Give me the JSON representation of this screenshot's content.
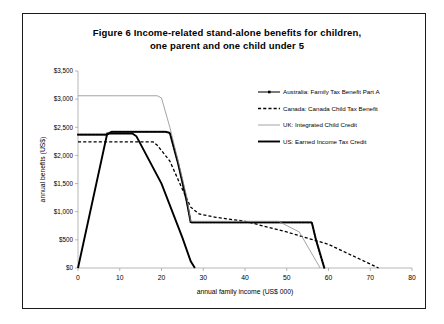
{
  "figure": {
    "title_line1": "Figure 6   Income-related stand-alone benefits for children,",
    "title_line2": "one parent and one child under 5"
  },
  "chart_data": {
    "type": "line",
    "title": "Figure 6 Income-related stand-alone benefits for children, one parent and one child under 5",
    "xlabel": "annual family income (US$ 000)",
    "ylabel": "annual benefits (US$)",
    "xlim": [
      0,
      80
    ],
    "ylim": [
      0,
      3500
    ],
    "xticks": [
      0,
      10,
      20,
      30,
      40,
      50,
      60,
      70,
      80
    ],
    "xtick_labels": [
      "0",
      "10",
      "20",
      "30",
      "40",
      "50",
      "60",
      "70",
      "80"
    ],
    "yticks": [
      0,
      500,
      1000,
      1500,
      2000,
      2500,
      3000,
      3500
    ],
    "ytick_labels": [
      "$0",
      "$500",
      "$1,000",
      "$1,500",
      "$2,000",
      "$2,500",
      "$3,000",
      "$3,500"
    ],
    "grid": false,
    "legend_position": "upper right",
    "series": [
      {
        "name": "Australia: Family Tax Benefit Part A",
        "style": "solid-with-square-markers",
        "color": "#000000",
        "points": [
          [
            0,
            2370
          ],
          [
            7,
            2370
          ],
          [
            8,
            2420
          ],
          [
            13,
            2420
          ],
          [
            21,
            2420
          ],
          [
            22,
            2400
          ],
          [
            24,
            1850
          ],
          [
            26,
            1200
          ],
          [
            27,
            810
          ],
          [
            40,
            810
          ],
          [
            56,
            810
          ],
          [
            57,
            500
          ],
          [
            59,
            0
          ]
        ]
      },
      {
        "name": "Canada: Canada Child Tax Benefit",
        "style": "dashed",
        "color": "#000000",
        "points": [
          [
            0,
            2240
          ],
          [
            7,
            2240
          ],
          [
            18,
            2240
          ],
          [
            19,
            2180
          ],
          [
            22,
            1900
          ],
          [
            25,
            1400
          ],
          [
            27,
            1080
          ],
          [
            29,
            960
          ],
          [
            33,
            900
          ],
          [
            40,
            830
          ],
          [
            50,
            640
          ],
          [
            60,
            420
          ],
          [
            72,
            0
          ]
        ]
      },
      {
        "name": "UK: Integrated Child Credit",
        "style": "thin-solid",
        "color": "#8d8d8d",
        "points": [
          [
            0,
            3060
          ],
          [
            10,
            3060
          ],
          [
            19,
            3060
          ],
          [
            20,
            3020
          ],
          [
            22,
            2500
          ],
          [
            24,
            1900
          ],
          [
            26,
            1280
          ],
          [
            27,
            830
          ],
          [
            40,
            830
          ],
          [
            48,
            830
          ],
          [
            53,
            640
          ],
          [
            58,
            0
          ]
        ]
      },
      {
        "name": "US: Earned Income Tax Credit",
        "style": "thick-solid",
        "color": "#000000",
        "points": [
          [
            0,
            0
          ],
          [
            7,
            2390
          ],
          [
            13,
            2390
          ],
          [
            14,
            2340
          ],
          [
            20,
            1500
          ],
          [
            25,
            540
          ],
          [
            27,
            120
          ],
          [
            28,
            0
          ]
        ]
      }
    ]
  },
  "legend": {
    "items": [
      {
        "label": "Australia: Family Tax Benefit Part A",
        "marker": "line-with-square"
      },
      {
        "label": "Canada: Canada Child Tax Benefit",
        "marker": "dashed-line"
      },
      {
        "label": "UK: Integrated Child Credit",
        "marker": "thin-line"
      },
      {
        "label": "US: Earned Income Tax Credit",
        "marker": "thick-line"
      }
    ]
  }
}
